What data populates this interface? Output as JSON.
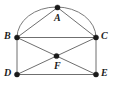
{
  "figure": {
    "kind": "geometry-diagram",
    "width": 114,
    "height": 92,
    "background_color": "#ffffff",
    "line_color": "#6f6f6f",
    "arc_color": "#7a7a7a",
    "dot_color": "#1a1a1a",
    "label_color": "#1c1c1c",
    "points": [
      {
        "id": "A",
        "label": "A",
        "x": 57.5,
        "y": 7.5,
        "label_x": 55.0,
        "label_y": 13.0
      },
      {
        "id": "B",
        "label": "B",
        "x": 17.0,
        "y": 37.5,
        "label_x": 5.5,
        "label_y": 31.5
      },
      {
        "id": "C",
        "label": "C",
        "x": 96.0,
        "y": 37.5,
        "label_x": 100.0,
        "label_y": 31.5
      },
      {
        "id": "D",
        "label": "D",
        "x": 17.0,
        "y": 74.5,
        "label_x": 5.5,
        "label_y": 68.5
      },
      {
        "id": "E",
        "label": "E",
        "x": 96.0,
        "y": 74.5,
        "label_x": 100.0,
        "label_y": 68.5
      },
      {
        "id": "F",
        "label": "F",
        "x": 56.5,
        "y": 56.0,
        "label_x": 54.5,
        "label_y": 61.5
      }
    ],
    "segments": [
      {
        "id": "AB",
        "from": "A",
        "to": "B"
      },
      {
        "id": "AC",
        "from": "A",
        "to": "C"
      },
      {
        "id": "BC",
        "from": "B",
        "to": "C"
      },
      {
        "id": "BD",
        "from": "B",
        "to": "D"
      },
      {
        "id": "CE",
        "from": "C",
        "to": "E"
      },
      {
        "id": "DE",
        "from": "D",
        "to": "E"
      },
      {
        "id": "BE",
        "from": "B",
        "to": "E"
      },
      {
        "id": "DC",
        "from": "D",
        "to": "C"
      }
    ],
    "arcs": [
      {
        "id": "arc-BAC",
        "from": "B",
        "through": "A",
        "to": "C",
        "path": "M 17 37.5 A 39.5 30 0 0 1 96 37.5"
      }
    ]
  }
}
